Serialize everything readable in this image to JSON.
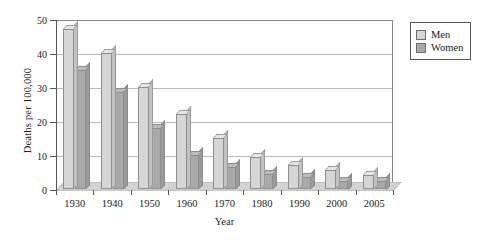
{
  "chart_data": {
    "type": "bar",
    "title": "",
    "xlabel": "Year",
    "ylabel": "Deaths per 100,000",
    "categories": [
      "1930",
      "1940",
      "1950",
      "1960",
      "1970",
      "1980",
      "1990",
      "2000",
      "2005"
    ],
    "series": [
      {
        "name": "Men",
        "color": "#d6d6d6",
        "values": [
          47,
          40,
          30,
          22,
          15,
          9.5,
          7,
          5.5,
          4
        ]
      },
      {
        "name": "Women",
        "color": "#a9a9a9",
        "values": [
          35,
          28.5,
          18,
          10,
          6.5,
          4.5,
          3.5,
          2.5,
          2.5
        ]
      }
    ],
    "ylim": [
      0,
      50
    ],
    "yticks": [
      0,
      10,
      20,
      30,
      40,
      50
    ],
    "ytick_labels": [
      "0",
      "10",
      "20",
      "30",
      "40",
      "50"
    ],
    "grid": true,
    "legend_position": "right-top",
    "style": "3d-grouped-bar"
  },
  "legend": {
    "entries": [
      {
        "label": "Men"
      },
      {
        "label": "Women"
      }
    ]
  },
  "axes": {
    "y_title": "Deaths per 100,000",
    "x_title": "Year"
  }
}
